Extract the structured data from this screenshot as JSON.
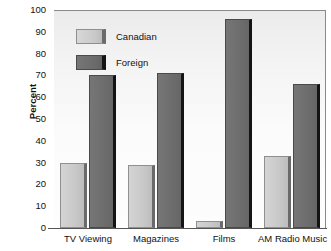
{
  "chart_data": {
    "type": "bar",
    "title": "",
    "subtitle": "",
    "xlabel": "",
    "ylabel": "Percent",
    "categories": [
      "TV Viewing",
      "Magazines",
      "Films",
      "AM Radio Music"
    ],
    "series": [
      {
        "name": "Canadian",
        "color": "#c9c9c9",
        "values": [
          30,
          29,
          3,
          33
        ]
      },
      {
        "name": "Foreign",
        "color": "#6d6d6d",
        "values": [
          70,
          71,
          96,
          66
        ]
      }
    ],
    "ylim": [
      0,
      100
    ],
    "yticks": [
      0,
      10,
      20,
      30,
      40,
      50,
      60,
      70,
      80,
      90,
      100
    ],
    "ytick_labels": [
      "0",
      "10",
      "20",
      "30",
      "40",
      "50",
      "60",
      "70",
      "80",
      "90",
      "100"
    ],
    "grid": false,
    "legend_position": "upper-left-inside",
    "legend_entries": [
      "Canadian",
      "Foreign"
    ],
    "annotations": []
  }
}
